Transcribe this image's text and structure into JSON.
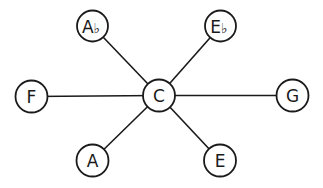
{
  "diagram": {
    "title": "",
    "center": "C",
    "nodes": [
      {
        "id": "C",
        "label": "C",
        "accidental": "",
        "x": 159,
        "y": 95.5,
        "r": 16
      },
      {
        "id": "Ab",
        "label": "A",
        "accidental": "♭",
        "x": 92.5,
        "y": 26,
        "r": 15.5
      },
      {
        "id": "Eb",
        "label": "E",
        "accidental": "♭",
        "x": 220.5,
        "y": 26,
        "r": 15.5
      },
      {
        "id": "F",
        "label": "F",
        "accidental": "",
        "x": 31.5,
        "y": 96.5,
        "r": 16
      },
      {
        "id": "G",
        "label": "G",
        "accidental": "",
        "x": 292.5,
        "y": 95.5,
        "r": 16
      },
      {
        "id": "A",
        "label": "A",
        "accidental": "",
        "x": 92.5,
        "y": 160.5,
        "r": 16
      },
      {
        "id": "E",
        "label": "E",
        "accidental": "",
        "x": 220,
        "y": 160.5,
        "r": 16
      }
    ],
    "edges": [
      {
        "from": "C",
        "to": "Ab"
      },
      {
        "from": "C",
        "to": "Eb"
      },
      {
        "from": "C",
        "to": "F"
      },
      {
        "from": "C",
        "to": "G"
      },
      {
        "from": "C",
        "to": "A"
      },
      {
        "from": "C",
        "to": "E"
      }
    ],
    "colors": {
      "stroke": "#1a1a1a",
      "fill": "#ffffff",
      "background": "#ffffff"
    }
  }
}
